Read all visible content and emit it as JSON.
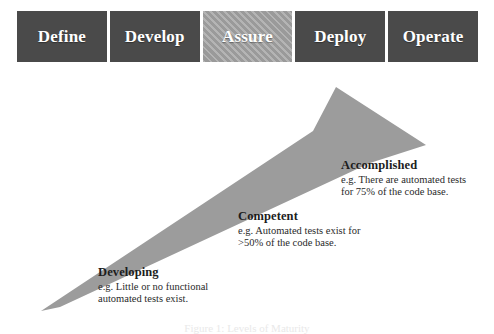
{
  "phases": {
    "items": [
      {
        "label": "Define",
        "style": "solid",
        "name": "phase-box-define"
      },
      {
        "label": "Develop",
        "style": "solid",
        "name": "phase-box-develop"
      },
      {
        "label": "Assure",
        "style": "hatched",
        "name": "phase-box-assure"
      },
      {
        "label": "Deploy",
        "style": "solid",
        "name": "phase-box-deploy"
      },
      {
        "label": "Operate",
        "style": "solid",
        "name": "phase-box-operate"
      }
    ]
  },
  "arrow": {
    "name": "maturity-arrow",
    "direction": "up-right",
    "fill_color": "#9c9c9c"
  },
  "annotations": [
    {
      "title": "Accomplished",
      "line1": "e.g. There are automated tests",
      "line2": "for 75% of the code base."
    },
    {
      "title": "Competent",
      "line1": "e.g. Automated tests exist for",
      "line2": ">50% of the code base."
    },
    {
      "title": "Developing",
      "line1": "e.g. Little or no functional",
      "line2": "automated tests exist."
    }
  ],
  "caption": {
    "text": "Figure 1: Levels of Maturity"
  },
  "colors": {
    "box_dark": "#4a4a4a",
    "box_hatch": "#a6a6a6",
    "arrow": "#9c9c9c",
    "text_dark": "#1d1d1d",
    "text_light": "#ffffff"
  }
}
